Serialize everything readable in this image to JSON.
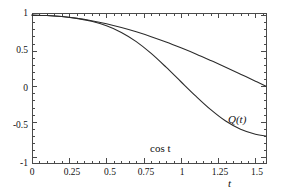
{
  "chart_data": {
    "type": "line",
    "title": "",
    "subtitle": "",
    "xlabel": "t",
    "ylabel": "",
    "xlim": [
      0,
      1.5708
    ],
    "ylim": [
      -1.08,
      1.03
    ],
    "grid": false,
    "frame": true,
    "legend_position": "inline-annotation",
    "x_ticks": [
      0,
      0.25,
      0.5,
      0.75,
      1,
      1.25,
      1.5
    ],
    "x_tick_labels": [
      "0",
      "0.25",
      "0.5",
      "0.75",
      "1",
      "1.25",
      "1.5"
    ],
    "x_minor_tick_step": 0.05,
    "y_ticks": [
      1,
      0.5,
      0,
      -0.5,
      -1
    ],
    "y_tick_labels": [
      "1",
      "0.5",
      "0",
      "-0.5",
      "-1"
    ],
    "y_minor_tick_step": 0.1,
    "series": [
      {
        "name": "Q(t)",
        "color": "#2b2b2b",
        "annotation": "Q(t)",
        "x": [
          0,
          0.1,
          0.2,
          0.3,
          0.4,
          0.5,
          0.6,
          0.7,
          0.8,
          0.9,
          1.0,
          1.1,
          1.2,
          1.3,
          1.4,
          1.5,
          1.5708
        ],
        "values": [
          1.0,
          0.995,
          0.98,
          0.954,
          0.913,
          0.85,
          0.757,
          0.628,
          0.462,
          0.268,
          0.063,
          -0.14,
          -0.33,
          -0.49,
          -0.605,
          -0.675,
          -0.7
        ]
      },
      {
        "name": "cos t",
        "color": "#2b2b2b",
        "annotation": "cos t",
        "x": [
          0,
          0.1,
          0.2,
          0.3,
          0.4,
          0.5,
          0.6,
          0.7,
          0.8,
          0.9,
          1.0,
          1.1,
          1.2,
          1.3,
          1.4,
          1.5,
          1.5708
        ],
        "values": [
          1.0,
          0.995,
          0.98,
          0.955,
          0.921,
          0.878,
          0.825,
          0.765,
          0.697,
          0.622,
          0.54,
          0.454,
          0.362,
          0.268,
          0.17,
          0.071,
          0.0
        ]
      }
    ]
  },
  "annotations": {
    "q_label": "Q(t)",
    "cos_label": "cos t",
    "x_axis_name": "t"
  },
  "colors": {
    "background": "#ffffff",
    "frame": "#4a4a4a",
    "curve": "#2b2b2b",
    "text": "#111111"
  }
}
